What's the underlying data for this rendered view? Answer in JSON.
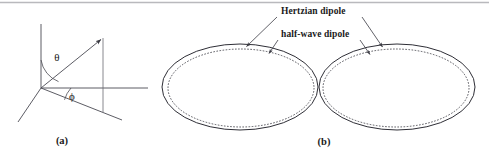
{
  "figure": {
    "background_color": "#ffffff",
    "ink_color": "#2e2e36",
    "width": 489,
    "height": 155
  },
  "panel_a": {
    "caption": "(a)",
    "caption_x": 62,
    "caption_y": 144,
    "origin": {
      "x": 41,
      "y": 88
    },
    "axes": [
      {
        "name": "z-axis",
        "x1": 41,
        "y1": 24,
        "x2": 41,
        "y2": 88
      },
      {
        "name": "y-axis",
        "x1": 41,
        "y1": 88,
        "x2": 148,
        "y2": 88
      },
      {
        "name": "x-axis",
        "x1": 18,
        "y1": 122,
        "x2": 41,
        "y2": 88
      }
    ],
    "vector": {
      "x1": 41,
      "y1": 88,
      "x2": 103,
      "y2": 38
    },
    "projection_line": {
      "x1": 41,
      "y1": 88,
      "x2": 122,
      "y2": 120
    },
    "drop_line": {
      "x1": 103,
      "y1": 38,
      "x2": 103,
      "y2": 112
    },
    "theta": {
      "symbol": "θ",
      "label_x": 57,
      "label_y": 61
    },
    "phi": {
      "symbol": "ϕ",
      "label_x": 72,
      "label_y": 99
    }
  },
  "panel_b": {
    "caption": "(b)",
    "caption_x": 324,
    "caption_y": 145,
    "lobes": [
      {
        "name": "left-lobe",
        "solid": {
          "cx": 240,
          "cy": 87,
          "rx": 78,
          "ry": 43
        },
        "dotted": {
          "cx": 241,
          "cy": 88,
          "rx": 73,
          "ry": 39
        }
      },
      {
        "name": "right-lobe",
        "solid": {
          "cx": 397,
          "cy": 87,
          "rx": 78,
          "ry": 43
        },
        "dotted": {
          "cx": 396,
          "cy": 88,
          "rx": 73,
          "ry": 39
        }
      }
    ],
    "callouts": [
      {
        "id": "hertzian",
        "label": "Hertzian dipole",
        "label_x": 281,
        "label_y": 14,
        "leaders": [
          {
            "x1": 277,
            "y1": 17,
            "x2": 245,
            "y2": 48
          },
          {
            "x1": 362,
            "y1": 17,
            "x2": 384,
            "y2": 49
          }
        ]
      },
      {
        "id": "half-wave",
        "label": "half-wave dipole",
        "label_x": 281,
        "label_y": 37,
        "leaders": [
          {
            "x1": 278,
            "y1": 40,
            "x2": 268,
            "y2": 55
          },
          {
            "x1": 360,
            "y1": 40,
            "x2": 371,
            "y2": 56
          }
        ]
      }
    ]
  }
}
